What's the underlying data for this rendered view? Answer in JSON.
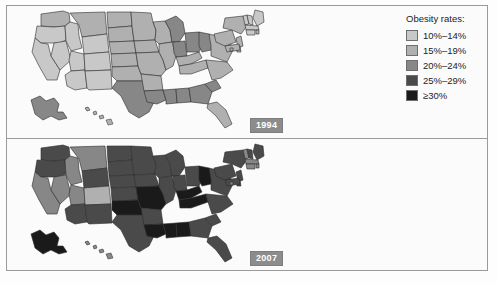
{
  "legend": {
    "title": "Obesity rates:",
    "entries": [
      {
        "label": "10%–14%",
        "color": "#c8c8c8"
      },
      {
        "label": "15%–19%",
        "color": "#b0b0b0"
      },
      {
        "label": "20%–24%",
        "color": "#878787"
      },
      {
        "label": "25%–29%",
        "color": "#4a4a4a"
      },
      {
        "label": "≥30%",
        "color": "#1a1a1a"
      }
    ]
  },
  "panels": [
    {
      "year": "1994",
      "name": "map-1994"
    },
    {
      "year": "2007",
      "name": "map-2007"
    }
  ],
  "chart_data": {
    "type": "heatmap",
    "title": "Obesity rates:",
    "subtitle": "",
    "xlabel": "",
    "ylabel": "",
    "legend_position": "right",
    "categories": [
      "10%–14%",
      "15%–19%",
      "20%–24%",
      "25%–29%",
      "≥30%"
    ],
    "category_colors": [
      "#c8c8c8",
      "#b0b0b0",
      "#878787",
      "#4a4a4a",
      "#1a1a1a"
    ],
    "annotations": [
      "1994",
      "2007"
    ],
    "series": [
      {
        "name": "1994",
        "values": {
          "WA": 1,
          "OR": 0,
          "CA": 0,
          "NV": 0,
          "ID": 0,
          "MT": 1,
          "WY": 0,
          "UT": 0,
          "AZ": 0,
          "CO": 0,
          "NM": 0,
          "ND": 1,
          "SD": 1,
          "NE": 1,
          "KS": 1,
          "OK": 1,
          "TX": 2,
          "MN": 1,
          "IA": 1,
          "MO": 1,
          "AR": 1,
          "LA": 2,
          "WI": 1,
          "IL": 1,
          "MS": 2,
          "AL": 2,
          "MI": 2,
          "IN": 2,
          "KY": 1,
          "TN": 1,
          "OH": 2,
          "WV": 2,
          "GA": 2,
          "FL": 1,
          "SC": 2,
          "NC": 1,
          "VA": 1,
          "PA": 1,
          "NY": 1,
          "ME": 0,
          "VT": 0,
          "NH": 0,
          "MA": 0,
          "RI": 1,
          "CT": 0,
          "NJ": 1,
          "DE": 1,
          "MD": 1,
          "DC": 1,
          "AK": 2,
          "HI": 1
        }
      },
      {
        "name": "2007",
        "values": {
          "WA": 3,
          "OR": 3,
          "CA": 2,
          "NV": 2,
          "ID": 2,
          "MT": 2,
          "WY": 3,
          "UT": 2,
          "AZ": 3,
          "CO": 1,
          "NM": 3,
          "ND": 3,
          "SD": 3,
          "NE": 3,
          "KS": 3,
          "OK": 4,
          "TX": 3,
          "MN": 3,
          "IA": 3,
          "MO": 4,
          "AR": 3,
          "LA": 4,
          "WI": 3,
          "IL": 3,
          "MS": 4,
          "AL": 4,
          "MI": 3,
          "IN": 3,
          "KY": 4,
          "TN": 4,
          "OH": 3,
          "WV": 4,
          "GA": 3,
          "FL": 3,
          "SC": 3,
          "NC": 3,
          "VA": 3,
          "PA": 3,
          "NY": 3,
          "ME": 3,
          "VT": 2,
          "NH": 3,
          "MA": 2,
          "RI": 2,
          "CT": 2,
          "NJ": 3,
          "DE": 3,
          "MD": 3,
          "DC": 2,
          "AK": 4,
          "HI": 2
        }
      }
    ]
  }
}
